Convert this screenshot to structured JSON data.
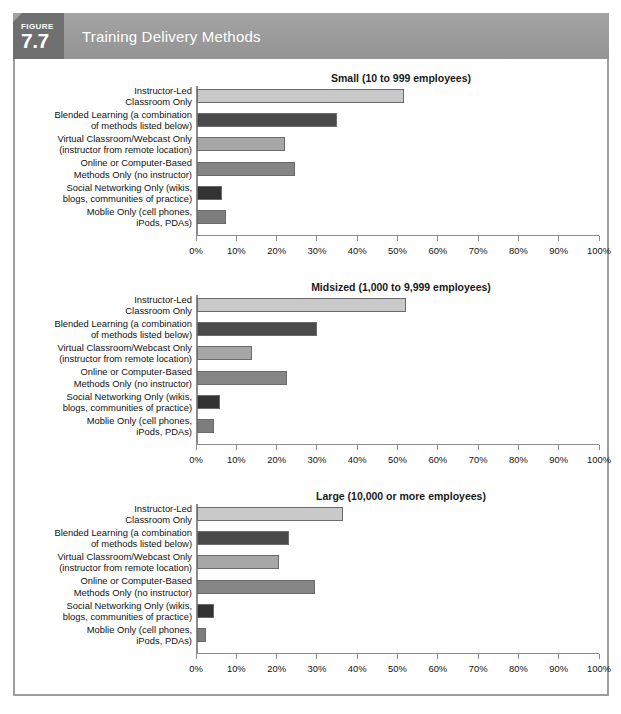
{
  "header": {
    "figure_word": "FIGURE",
    "figure_number": "7.7",
    "title": "Training Delivery Methods",
    "badge_color": "#6f6f6f",
    "banner_color": "#9a9a9a",
    "title_color": "#ffffff"
  },
  "source_note": "",
  "axis": {
    "tick_labels": [
      "0%",
      "10%",
      "20%",
      "30%",
      "40%",
      "50%",
      "60%",
      "70%",
      "80%",
      "90%",
      "100%"
    ],
    "min": 0,
    "max": 100,
    "step": 10
  },
  "categories": [
    "Instructor-Led\nClassroom Only",
    "Blended Learning (a combination\nof methods listed below)",
    "Virtual Classroom/Webcast Only\n(instructor from remote location)",
    "Online or Computer-Based\nMethods Only (no instructor)",
    "Social Networking Only (wikis,\nblogs, communities of practice)",
    "Moblie Only (cell phones,\niPods, PDAs)"
  ],
  "bar_colors": [
    "#c9c9c9",
    "#4a4a4a",
    "#a6a6a6",
    "#858585",
    "#333333",
    "#7d7d7d"
  ],
  "chart_data": [
    {
      "type": "bar",
      "orientation": "horizontal",
      "title": "Small (10 to 999 employees)",
      "xlabel": "",
      "ylabel": "",
      "xlim": [
        0,
        100
      ],
      "grid": false,
      "legend": "none",
      "categories": [
        "Instructor-Led Classroom Only",
        "Blended Learning (a combination of methods listed below)",
        "Virtual Classroom/Webcast Only (instructor from remote location)",
        "Online or Computer-Based Methods Only (no instructor)",
        "Social Networking Only (wikis, blogs, communities of practice)",
        "Moblie Only (cell phones, iPods, PDAs)"
      ],
      "values": [
        51.5,
        35,
        22,
        24.5,
        6.5,
        7.5
      ],
      "tick_labels": [
        "0%",
        "10%",
        "20%",
        "30%",
        "40%",
        "50%",
        "60%",
        "70%",
        "80%",
        "90%",
        "100%"
      ]
    },
    {
      "type": "bar",
      "orientation": "horizontal",
      "title": "Midsized (1,000 to 9,999 employees)",
      "xlabel": "",
      "ylabel": "",
      "xlim": [
        0,
        100
      ],
      "grid": false,
      "legend": "none",
      "categories": [
        "Instructor-Led Classroom Only",
        "Blended Learning (a combination of methods listed below)",
        "Virtual Classroom/Webcast Only (instructor from remote location)",
        "Online or Computer-Based Methods Only (no instructor)",
        "Social Networking Only (wikis, blogs, communities of practice)",
        "Moblie Only (cell phones, iPods, PDAs)"
      ],
      "values": [
        52,
        30,
        14,
        22.5,
        6,
        4.5
      ],
      "tick_labels": [
        "0%",
        "10%",
        "20%",
        "30%",
        "40%",
        "50%",
        "60%",
        "70%",
        "80%",
        "90%",
        "100%"
      ]
    },
    {
      "type": "bar",
      "orientation": "horizontal",
      "title": "Large (10,000 or more employees)",
      "xlabel": "",
      "ylabel": "",
      "xlim": [
        0,
        100
      ],
      "grid": false,
      "legend": "none",
      "categories": [
        "Instructor-Led Classroom Only",
        "Blended Learning (a combination of methods listed below)",
        "Virtual Classroom/Webcast Only (instructor from remote location)",
        "Online or Computer-Based Methods Only (no instructor)",
        "Social Networking Only (wikis, blogs, communities of practice)",
        "Moblie Only (cell phones, iPods, PDAs)"
      ],
      "values": [
        36.5,
        23,
        20.5,
        29.5,
        4.5,
        2.5
      ],
      "tick_labels": [
        "0%",
        "10%",
        "20%",
        "30%",
        "40%",
        "50%",
        "60%",
        "70%",
        "80%",
        "90%",
        "100%"
      ]
    }
  ]
}
